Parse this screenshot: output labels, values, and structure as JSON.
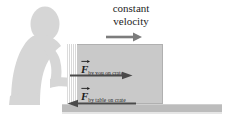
{
  "figure": {
    "name": "pushing-crate-free-body-diagram",
    "background_color": "#ffffff"
  },
  "caption": {
    "line1": "constant",
    "line2": "velocity"
  },
  "labels": {
    "force_by_you": {
      "symbol": "F",
      "subscript": "by you on crate",
      "full_text": "F by you on crate",
      "direction": "right"
    },
    "force_by_table": {
      "symbol": "F",
      "subscript": "by table on crate",
      "full_text": "F by table on crate",
      "direction": "left"
    }
  },
  "arrows": {
    "velocity": {
      "direction": "right",
      "color": "#7c7c7c"
    },
    "applied_force": {
      "direction": "right",
      "color": "#4a4a4a"
    },
    "friction_force": {
      "direction": "left",
      "color": "#4a4a4a"
    }
  },
  "objects": {
    "person": {
      "label": "person pushing",
      "color": "#d5d5d5"
    },
    "crate": {
      "label": "crate",
      "color": "#c9c9c9"
    },
    "table": {
      "label": "table surface",
      "color": "#bcbcbc"
    }
  }
}
